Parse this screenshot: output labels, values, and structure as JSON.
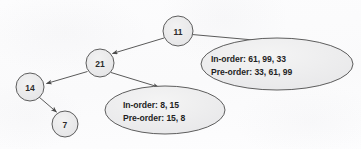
{
  "diagram": {
    "background_color": "#fdfdfd",
    "stroke_color": "#555555",
    "node_fill_color": "#ebebeb",
    "text_color": "#1f1f1f",
    "nodes": [
      {
        "id": "n11",
        "label": "11",
        "cx": 178,
        "cy": 31,
        "r": 15
      },
      {
        "id": "n21",
        "label": "21",
        "cx": 100,
        "cy": 63,
        "r": 14
      },
      {
        "id": "n14",
        "label": "14",
        "cx": 30,
        "cy": 87,
        "r": 14
      },
      {
        "id": "n7",
        "label": "7",
        "cx": 65,
        "cy": 124,
        "r": 13
      }
    ],
    "bubbles": [
      {
        "id": "bubble-right",
        "cx": 277,
        "cy": 64,
        "rx": 76,
        "ry": 26,
        "lines": [
          "In-order: 61, 99, 33",
          "Pre-order: 33, 61, 99"
        ],
        "text_x": 211,
        "text_y": 51
      },
      {
        "id": "bubble-bottom",
        "cx": 165,
        "cy": 110,
        "rx": 60,
        "ry": 24,
        "lines": [
          "In-order: 8, 15",
          "Pre-order: 15, 8"
        ],
        "text_x": 122,
        "text_y": 97
      }
    ],
    "edges": [
      {
        "id": "edge-11-to-21",
        "from": "11",
        "to": "21",
        "x1": 164,
        "y1": 38,
        "x2": 111,
        "y2": 54
      },
      {
        "id": "edge-11-to-right",
        "from": "11",
        "to": "bubble-right",
        "x1": 192,
        "y1": 35,
        "x2": 272,
        "y2": 42
      },
      {
        "id": "edge-21-to-14",
        "from": "21",
        "to": "14",
        "x1": 88,
        "y1": 72,
        "x2": 45,
        "y2": 84
      },
      {
        "id": "edge-21-to-bottom",
        "from": "21",
        "to": "bubble-bottom",
        "x1": 111,
        "y1": 73,
        "x2": 160,
        "y2": 88
      },
      {
        "id": "edge-14-to-7",
        "from": "14",
        "to": "7",
        "x1": 39,
        "y1": 97,
        "x2": 58,
        "y2": 113
      }
    ]
  }
}
